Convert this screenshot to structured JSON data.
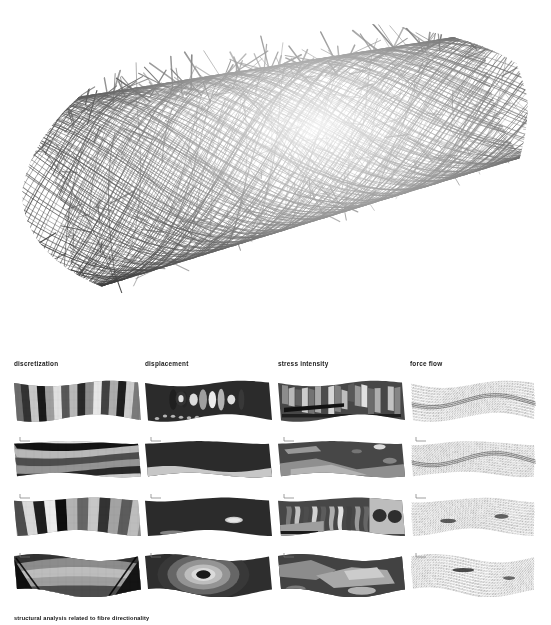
{
  "figure": {
    "caption": "structural analysis related to fibre directionality",
    "hero": {
      "name": "fibre-wound-cylinder-render",
      "description": "dense black filament-wound cylindrical mesh, perspective view",
      "line_color": "#262626",
      "background": "#ffffff"
    }
  },
  "columns": [
    {
      "id": "discretization",
      "label": "discretization"
    },
    {
      "id": "displacement",
      "label": "displacement"
    },
    {
      "id": "stress-intensity",
      "label": "stress intensity"
    },
    {
      "id": "force-flow",
      "label": "force flow"
    }
  ],
  "rows": [
    {
      "id": "row-1",
      "index": 1
    },
    {
      "id": "row-2",
      "index": 2
    },
    {
      "id": "row-3",
      "index": 3
    },
    {
      "id": "row-4",
      "index": 4
    }
  ],
  "chart_data": {
    "type": "heatmap",
    "title": "structural analysis related to fibre directionality",
    "layout": "4 rows x 4 columns of contour / vector field thumbnails",
    "columns": [
      "discretization",
      "displacement",
      "stress intensity",
      "force flow"
    ],
    "row_labels": [
      "row-1",
      "row-2",
      "row-3",
      "row-4"
    ],
    "colormap": "grayscale",
    "grid": false,
    "legend": "none",
    "cells": [
      {
        "row": 1,
        "column": "discretization",
        "pattern": "vertical banded strips",
        "bands": 16,
        "values": [
          0.42,
          0.2,
          0.78,
          0.1,
          0.62,
          0.88,
          0.34,
          0.72,
          0.16,
          0.55,
          0.9,
          0.26,
          0.68,
          0.12,
          0.8,
          0.48
        ]
      },
      {
        "row": 1,
        "column": "displacement",
        "pattern": "dark field with bright vertical lobes",
        "bands": 8,
        "values": [
          0.12,
          0.15,
          0.86,
          0.62,
          0.92,
          0.7,
          0.88,
          0.22
        ]
      },
      {
        "row": 1,
        "column": "stress intensity",
        "pattern": "high frequency vertical stress streaks",
        "bands": 18,
        "values": [
          0.55,
          0.72,
          0.38,
          0.8,
          0.45,
          0.66,
          0.3,
          0.84,
          0.5,
          0.74,
          0.35,
          0.6,
          0.88,
          0.42,
          0.68,
          0.28,
          0.76,
          0.52
        ]
      },
      {
        "row": 1,
        "column": "force flow",
        "pattern": "dense vertical vector hatch field",
        "density": 96
      },
      {
        "row": 2,
        "column": "discretization",
        "pattern": "horizontal contour bands, shallow wave",
        "bands": 7,
        "values": [
          0.9,
          0.08,
          0.72,
          0.3,
          0.58,
          0.16,
          0.8
        ]
      },
      {
        "row": 2,
        "column": "displacement",
        "pattern": "uniform dark field, light lower edge",
        "bands": 3,
        "values": [
          0.18,
          0.22,
          0.78
        ]
      },
      {
        "row": 2,
        "column": "stress intensity",
        "pattern": "irregular mid-grey blobs on dark",
        "bands": 6,
        "values": [
          0.24,
          0.58,
          0.7,
          0.34,
          0.62,
          0.44
        ]
      },
      {
        "row": 2,
        "column": "force flow",
        "pattern": "vector hatch with diagonal shear band",
        "density": 92
      },
      {
        "row": 3,
        "column": "discretization",
        "pattern": "curved arc bands across section",
        "bands": 12,
        "values": [
          0.3,
          0.85,
          0.12,
          0.92,
          0.05,
          0.7,
          0.4,
          0.78,
          0.2,
          0.64,
          0.36,
          0.74
        ]
      },
      {
        "row": 3,
        "column": "displacement",
        "pattern": "near-uniform dark with small bright patch",
        "bands": 3,
        "values": [
          0.16,
          0.14,
          0.82
        ]
      },
      {
        "row": 3,
        "column": "stress intensity",
        "pattern": "vertical ribs plus two round hot spots",
        "bands": 10,
        "values": [
          0.48,
          0.76,
          0.3,
          0.82,
          0.36,
          0.68,
          0.88,
          0.26,
          0.6,
          0.4
        ]
      },
      {
        "row": 3,
        "column": "force flow",
        "pattern": "radiating vector field with dark cores",
        "density": 88
      },
      {
        "row": 4,
        "column": "discretization",
        "pattern": "smooth saddle gradient with dark wedges",
        "bands": 5,
        "values": [
          0.2,
          0.55,
          0.74,
          0.62,
          0.3
        ]
      },
      {
        "row": 4,
        "column": "displacement",
        "pattern": "concentric contour rings, dark core centre",
        "bands": 6,
        "values": [
          0.22,
          0.4,
          0.58,
          0.74,
          0.86,
          0.1
        ]
      },
      {
        "row": 4,
        "column": "stress intensity",
        "pattern": "marbled mid-grey contour islands",
        "bands": 6,
        "values": [
          0.26,
          0.48,
          0.66,
          0.8,
          0.38,
          0.56
        ]
      },
      {
        "row": 4,
        "column": "force flow",
        "pattern": "vector hatch with central dark streak",
        "density": 90
      }
    ]
  }
}
